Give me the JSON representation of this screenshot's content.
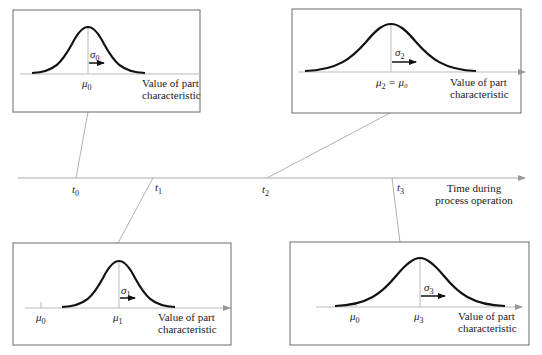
{
  "figure": {
    "timeline": {
      "axis_label_line1": "Time during",
      "axis_label_line2": "process operation",
      "ticks": [
        {
          "var": "t",
          "sub": "0",
          "x": 76
        },
        {
          "var": "t",
          "sub": "1",
          "x": 153
        },
        {
          "var": "t",
          "sub": "2",
          "x": 267
        },
        {
          "var": "t",
          "sub": "3",
          "x": 392
        }
      ]
    },
    "panels": [
      {
        "id": "t0",
        "mean_label": {
          "var": "μ",
          "sub": "0",
          "suffix": ""
        },
        "sigma_label": {
          "var": "σ",
          "sub": "0"
        },
        "ref_mean_label": null,
        "axis_label_line1": "Value of part",
        "axis_label_line2": "characteristic",
        "description": "Initial distribution: mean at target μ0, spread σ0"
      },
      {
        "id": "t2",
        "mean_label": {
          "var": "μ",
          "sub": "2",
          "suffix": " = μ₀"
        },
        "sigma_label": {
          "var": "σ",
          "sub": "2"
        },
        "ref_mean_label": null,
        "axis_label_line1": "Value of part",
        "axis_label_line2": "characteristic",
        "description": "Mean back at μ0 but spread increased (σ2 > σ0)"
      },
      {
        "id": "t1",
        "mean_label": {
          "var": "μ",
          "sub": "1",
          "suffix": ""
        },
        "sigma_label": {
          "var": "σ",
          "sub": "1"
        },
        "ref_mean_label": {
          "var": "μ",
          "sub": "0"
        },
        "axis_label_line1": "Value of part",
        "axis_label_line2": "characteristic",
        "description": "Mean shifted from μ0 to μ1, spread unchanged"
      },
      {
        "id": "t3",
        "mean_label": {
          "var": "μ",
          "sub": "3",
          "suffix": ""
        },
        "sigma_label": {
          "var": "σ",
          "sub": "3"
        },
        "ref_mean_label": {
          "var": "μ",
          "sub": "0"
        },
        "axis_label_line1": "Value of part",
        "axis_label_line2": "characteristic",
        "description": "Mean shifted to μ3 and spread increased"
      }
    ],
    "colors": {
      "curve": "#111111",
      "box_border": "#666666",
      "axis": "#999999",
      "leader": "#a0a0a0",
      "arrow": "#111111"
    }
  }
}
